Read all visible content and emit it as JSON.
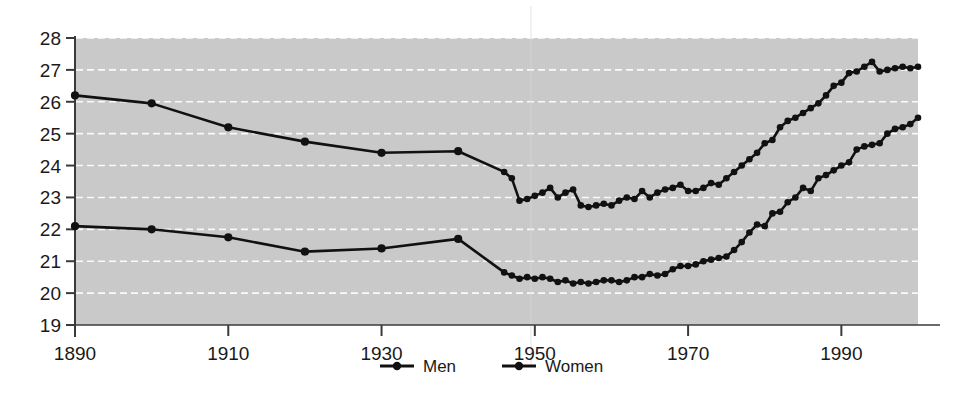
{
  "chart_data": {
    "type": "line",
    "title": "",
    "subtitle": "",
    "xlabel": "",
    "ylabel": "",
    "xlim": [
      1890,
      2000
    ],
    "ylim": [
      19,
      28
    ],
    "grid": true,
    "grid_axis": "y",
    "legend_position": "bottom-center",
    "plot_background": "#c9c9c9",
    "gridline_color": "#ffffff",
    "line_color": "#111111",
    "marker": "circle",
    "xticks": [
      1890,
      1910,
      1930,
      1950,
      1970,
      1990
    ],
    "xtick_labels": [
      "1890",
      "1910",
      "1930",
      "1950",
      "1970",
      "1990"
    ],
    "yticks": [
      19,
      20,
      21,
      22,
      23,
      24,
      25,
      26,
      27,
      28
    ],
    "ytick_labels": [
      "19",
      "20",
      "21",
      "22",
      "23",
      "24",
      "25",
      "26",
      "27",
      "28"
    ],
    "series": [
      {
        "name": "Men",
        "color": "#111111",
        "x": [
          1890,
          1900,
          1910,
          1920,
          1930,
          1940,
          1946,
          1947,
          1948,
          1949,
          1950,
          1951,
          1952,
          1953,
          1954,
          1955,
          1956,
          1957,
          1958,
          1959,
          1960,
          1961,
          1962,
          1963,
          1964,
          1965,
          1966,
          1967,
          1968,
          1969,
          1970,
          1971,
          1972,
          1973,
          1974,
          1975,
          1976,
          1977,
          1978,
          1979,
          1980,
          1981,
          1982,
          1983,
          1984,
          1985,
          1986,
          1987,
          1988,
          1989,
          1990,
          1991,
          1992,
          1993,
          1994,
          1995,
          1996,
          1997,
          1998,
          1999,
          2000
        ],
        "values": [
          26.2,
          25.95,
          25.2,
          24.75,
          24.4,
          24.45,
          23.8,
          23.6,
          22.9,
          22.95,
          23.05,
          23.15,
          23.3,
          23.0,
          23.15,
          23.25,
          22.75,
          22.7,
          22.75,
          22.8,
          22.75,
          22.9,
          23.0,
          22.95,
          23.2,
          23.0,
          23.15,
          23.25,
          23.3,
          23.4,
          23.2,
          23.2,
          23.3,
          23.45,
          23.4,
          23.6,
          23.8,
          24.0,
          24.2,
          24.4,
          24.7,
          24.8,
          25.2,
          25.4,
          25.5,
          25.65,
          25.8,
          25.95,
          26.2,
          26.5,
          26.6,
          26.9,
          26.95,
          27.1,
          27.25,
          26.95,
          27.0,
          27.05,
          27.1,
          27.05,
          27.1
        ]
      },
      {
        "name": "Women",
        "color": "#111111",
        "x": [
          1890,
          1900,
          1910,
          1920,
          1930,
          1940,
          1946,
          1947,
          1948,
          1949,
          1950,
          1951,
          1952,
          1953,
          1954,
          1955,
          1956,
          1957,
          1958,
          1959,
          1960,
          1961,
          1962,
          1963,
          1964,
          1965,
          1966,
          1967,
          1968,
          1969,
          1970,
          1971,
          1972,
          1973,
          1974,
          1975,
          1976,
          1977,
          1978,
          1979,
          1980,
          1981,
          1982,
          1983,
          1984,
          1985,
          1986,
          1987,
          1988,
          1989,
          1990,
          1991,
          1992,
          1993,
          1994,
          1995,
          1996,
          1997,
          1998,
          1999,
          2000
        ],
        "values": [
          22.1,
          22.0,
          21.75,
          21.3,
          21.4,
          21.7,
          20.65,
          20.55,
          20.45,
          20.5,
          20.45,
          20.5,
          20.45,
          20.35,
          20.4,
          20.3,
          20.35,
          20.3,
          20.35,
          20.4,
          20.4,
          20.35,
          20.4,
          20.5,
          20.5,
          20.6,
          20.55,
          20.6,
          20.75,
          20.85,
          20.85,
          20.9,
          21.0,
          21.05,
          21.1,
          21.15,
          21.35,
          21.6,
          21.9,
          22.15,
          22.1,
          22.5,
          22.55,
          22.85,
          23.0,
          23.3,
          23.2,
          23.6,
          23.7,
          23.85,
          24.0,
          24.1,
          24.5,
          24.6,
          24.65,
          24.7,
          25.0,
          25.15,
          25.2,
          25.3,
          25.5
        ]
      }
    ]
  },
  "axes": {
    "x_tick_labels": [
      "1890",
      "1910",
      "1930",
      "1950",
      "1970",
      "1990"
    ],
    "y_tick_labels": [
      "28",
      "27",
      "26",
      "25",
      "24",
      "23",
      "22",
      "21",
      "20",
      "19"
    ]
  },
  "legend": {
    "items": [
      {
        "label": "Men",
        "marker": "line-with-dot"
      },
      {
        "label": "Women",
        "marker": "line-with-dot"
      }
    ]
  }
}
